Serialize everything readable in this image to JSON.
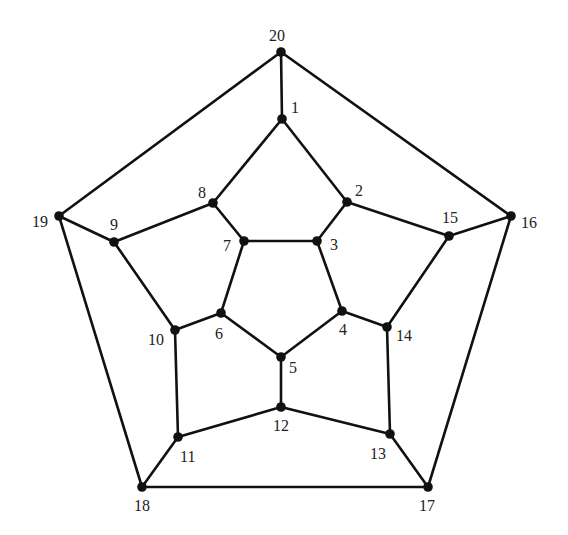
{
  "diagram": {
    "type": "planar-graph",
    "nodes": [
      {
        "id": "1",
        "x": 282,
        "y": 119,
        "lx": 291,
        "ly": 113
      },
      {
        "id": "2",
        "x": 347,
        "y": 202,
        "lx": 355,
        "ly": 196
      },
      {
        "id": "3",
        "x": 317,
        "y": 241,
        "lx": 330,
        "ly": 250
      },
      {
        "id": "4",
        "x": 342,
        "y": 311,
        "lx": 339,
        "ly": 335
      },
      {
        "id": "5",
        "x": 281,
        "y": 357,
        "lx": 289,
        "ly": 373
      },
      {
        "id": "6",
        "x": 221,
        "y": 313,
        "lx": 215,
        "ly": 339
      },
      {
        "id": "7",
        "x": 244,
        "y": 241,
        "lx": 223,
        "ly": 251
      },
      {
        "id": "8",
        "x": 213,
        "y": 203,
        "lx": 198,
        "ly": 198
      },
      {
        "id": "9",
        "x": 114,
        "y": 242,
        "lx": 110,
        "ly": 230
      },
      {
        "id": "10",
        "x": 175,
        "y": 330,
        "lx": 148,
        "ly": 345
      },
      {
        "id": "11",
        "x": 178,
        "y": 437,
        "lx": 180,
        "ly": 462
      },
      {
        "id": "12",
        "x": 281,
        "y": 407,
        "lx": 273,
        "ly": 431
      },
      {
        "id": "13",
        "x": 390,
        "y": 434,
        "lx": 370,
        "ly": 459
      },
      {
        "id": "14",
        "x": 387,
        "y": 327,
        "lx": 396,
        "ly": 341
      },
      {
        "id": "15",
        "x": 449,
        "y": 236,
        "lx": 442,
        "ly": 223
      },
      {
        "id": "16",
        "x": 511,
        "y": 216,
        "lx": 521,
        "ly": 228
      },
      {
        "id": "17",
        "x": 428,
        "y": 487,
        "lx": 419,
        "ly": 511
      },
      {
        "id": "18",
        "x": 142,
        "y": 487,
        "lx": 134,
        "ly": 511
      },
      {
        "id": "19",
        "x": 59,
        "y": 216,
        "lx": 32,
        "ly": 227
      },
      {
        "id": "20",
        "x": 281,
        "y": 52,
        "lx": 269,
        "ly": 41
      }
    ],
    "edges": [
      [
        "20",
        "1"
      ],
      [
        "20",
        "19"
      ],
      [
        "20",
        "16"
      ],
      [
        "1",
        "2"
      ],
      [
        "1",
        "8"
      ],
      [
        "2",
        "3"
      ],
      [
        "2",
        "15"
      ],
      [
        "3",
        "4"
      ],
      [
        "3",
        "7"
      ],
      [
        "4",
        "5"
      ],
      [
        "4",
        "14"
      ],
      [
        "5",
        "6"
      ],
      [
        "5",
        "12"
      ],
      [
        "6",
        "7"
      ],
      [
        "6",
        "10"
      ],
      [
        "7",
        "8"
      ],
      [
        "8",
        "9"
      ],
      [
        "9",
        "10"
      ],
      [
        "9",
        "19"
      ],
      [
        "10",
        "11"
      ],
      [
        "11",
        "12"
      ],
      [
        "11",
        "18"
      ],
      [
        "12",
        "13"
      ],
      [
        "13",
        "14"
      ],
      [
        "13",
        "17"
      ],
      [
        "14",
        "15"
      ],
      [
        "15",
        "16"
      ],
      [
        "16",
        "17"
      ],
      [
        "17",
        "18"
      ],
      [
        "18",
        "19"
      ]
    ]
  }
}
